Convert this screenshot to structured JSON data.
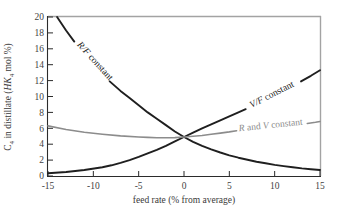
{
  "figure": {
    "x_axis": {
      "label": "feed rate (% from average)",
      "ticks": [
        -15,
        -10,
        -5,
        0,
        5,
        10,
        15
      ]
    },
    "y_axis": {
      "label_parts": {
        "c": "C",
        "c_sub": "4",
        "mid": " in distillate (",
        "hk": "HK",
        "hk_sub": "4",
        "tail": " mol %)"
      },
      "ticks": [
        0,
        2,
        4,
        6,
        8,
        10,
        12,
        14,
        16,
        18,
        20
      ]
    },
    "colors": {
      "curve_black": "#1f1f1f",
      "curve_gray": "#8c8c8c",
      "frame_gray": "#a3a3a3",
      "axis_black": "#2b2b2b",
      "tick_text": "#3f3f3f"
    }
  },
  "labels": {
    "rf": {
      "var": "R/F",
      "rest": " constant"
    },
    "vf": {
      "var": "V/F",
      "rest": " constant"
    },
    "rv": {
      "r": "R",
      "and": " and ",
      "v": "V",
      "rest": " constant"
    }
  },
  "chart_data": {
    "type": "line",
    "title": "",
    "xlabel": "feed rate (% from average)",
    "ylabel": "C4 in distillate (HK4 mol %)",
    "xlim": [
      -15,
      15
    ],
    "ylim": [
      0,
      20
    ],
    "grid": false,
    "legend": "labels placed inline on curves",
    "series": [
      {
        "name": "R/F constant",
        "color": "#1f1f1f",
        "width": 1.9,
        "segments": [
          [
            [
              -14,
              20
            ],
            [
              -13,
              18.3
            ],
            [
              -12.1,
              16.9
            ]
          ],
          [
            [
              -8.2,
              11.9
            ],
            [
              -7,
              10.7
            ],
            [
              -6,
              9.8
            ],
            [
              -5,
              8.9
            ],
            [
              -4,
              8.0
            ],
            [
              -3,
              7.2
            ],
            [
              -2,
              6.4
            ],
            [
              -1,
              5.6
            ],
            [
              0,
              4.9
            ],
            [
              1,
              4.3
            ],
            [
              2,
              3.8
            ],
            [
              3,
              3.35
            ],
            [
              4,
              2.95
            ],
            [
              5,
              2.6
            ],
            [
              6,
              2.3
            ],
            [
              7,
              2.05
            ],
            [
              8,
              1.8
            ],
            [
              9,
              1.6
            ],
            [
              10,
              1.4
            ],
            [
              11,
              1.25
            ],
            [
              12,
              1.1
            ],
            [
              13,
              0.95
            ],
            [
              14,
              0.85
            ],
            [
              15,
              0.75
            ]
          ]
        ]
      },
      {
        "name": "V/F constant",
        "color": "#1f1f1f",
        "width": 1.9,
        "segments": [
          [
            [
              -15,
              0.35
            ],
            [
              -13,
              0.5
            ],
            [
              -11,
              0.75
            ],
            [
              -9,
              1.1
            ],
            [
              -8,
              1.35
            ],
            [
              -7,
              1.65
            ],
            [
              -6,
              2.0
            ],
            [
              -5,
              2.4
            ],
            [
              -4,
              2.85
            ],
            [
              -3,
              3.3
            ],
            [
              -2,
              3.8
            ],
            [
              -1,
              4.35
            ],
            [
              0,
              4.9
            ],
            [
              1,
              5.45
            ],
            [
              2,
              6.0
            ],
            [
              3,
              6.5
            ],
            [
              4,
              7.0
            ],
            [
              5,
              7.5
            ],
            [
              6,
              8.0
            ],
            [
              6.8,
              8.4
            ]
          ],
          [
            [
              12.9,
              11.9
            ],
            [
              14,
              12.6
            ],
            [
              15,
              13.3
            ]
          ]
        ]
      },
      {
        "name": "R and V constant",
        "color": "#8c8c8c",
        "width": 1.6,
        "segments": [
          [
            [
              -15,
              6.3
            ],
            [
              -13,
              5.85
            ],
            [
              -11,
              5.5
            ],
            [
              -9,
              5.25
            ],
            [
              -7,
              5.05
            ],
            [
              -5,
              4.9
            ],
            [
              -4,
              4.85
            ],
            [
              -3,
              4.82
            ],
            [
              -2,
              4.8
            ],
            [
              -1,
              4.83
            ],
            [
              0,
              4.9
            ],
            [
              1,
              5.0
            ],
            [
              2,
              5.1
            ],
            [
              3,
              5.25
            ],
            [
              4,
              5.4
            ],
            [
              5,
              5.55
            ],
            [
              5.8,
              5.7
            ]
          ],
          [
            [
              13.6,
              6.6
            ],
            [
              14.5,
              6.75
            ],
            [
              15,
              6.85
            ]
          ]
        ]
      }
    ]
  }
}
